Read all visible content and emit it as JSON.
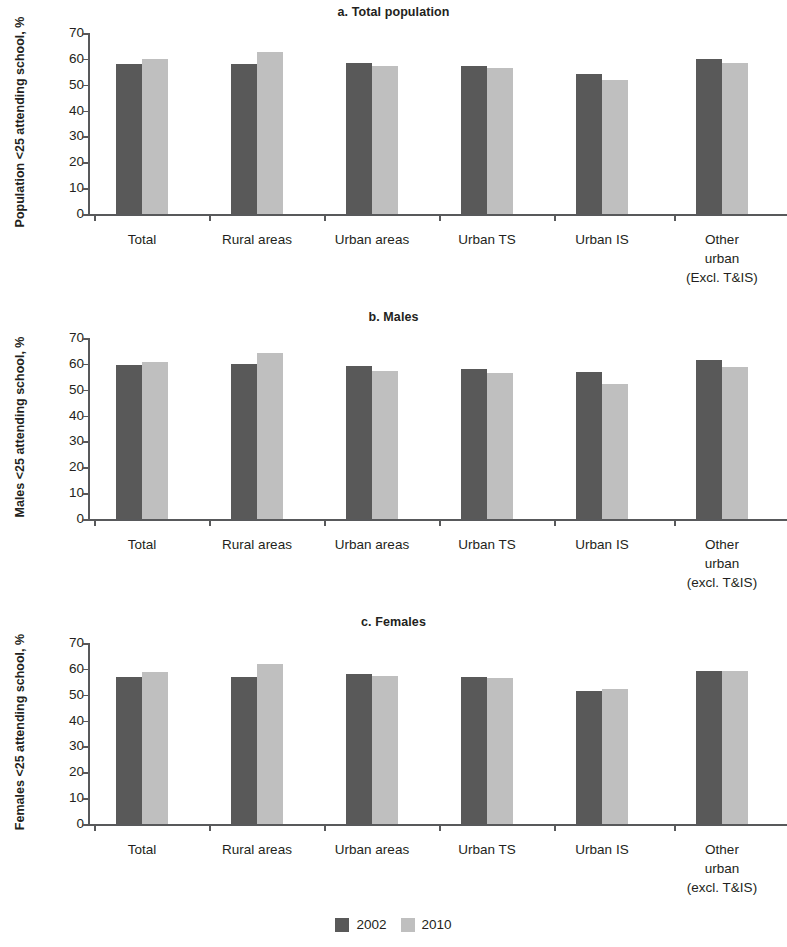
{
  "figure": {
    "legend": {
      "position": "bottom-center",
      "entries": [
        {
          "label": "2002",
          "color": "#595959"
        },
        {
          "label": "2010",
          "color": "#bfbfbf"
        }
      ]
    }
  },
  "chart_data": [
    {
      "type": "bar",
      "id": "a",
      "title": "a. Total population",
      "xlabel": "",
      "ylabel": "Population <25 attending school, %",
      "ylim": [
        0,
        70
      ],
      "yticks": [
        0,
        10,
        20,
        30,
        40,
        50,
        60,
        70
      ],
      "grid": false,
      "categories": [
        "Total",
        "Rural areas",
        "Urban areas",
        "Urban TS",
        "Urban IS",
        "Other urban (Excl. T&IS)"
      ],
      "category_lines": [
        [
          "Total"
        ],
        [
          "Rural areas"
        ],
        [
          "Urban areas"
        ],
        [
          "Urban TS"
        ],
        [
          "Urban IS"
        ],
        [
          "Other",
          "urban",
          "(Excl. T&IS)"
        ]
      ],
      "series": [
        {
          "name": "2002",
          "color": "#595959",
          "values": [
            58.0,
            58.0,
            58.3,
            57.4,
            54.0,
            59.8
          ]
        },
        {
          "name": "2010",
          "color": "#bfbfbf",
          "values": [
            60.1,
            62.5,
            57.3,
            56.4,
            52.0,
            58.5
          ]
        }
      ]
    },
    {
      "type": "bar",
      "id": "b",
      "title": "b. Males",
      "xlabel": "",
      "ylabel": "Males <25 attending school, %",
      "ylim": [
        0,
        70
      ],
      "yticks": [
        0,
        10,
        20,
        30,
        40,
        50,
        60,
        70
      ],
      "grid": false,
      "categories": [
        "Total",
        "Rural areas",
        "Urban areas",
        "Urban TS",
        "Urban IS",
        "Other urban (excl. T&IS)"
      ],
      "category_lines": [
        [
          "Total"
        ],
        [
          "Rural areas"
        ],
        [
          "Urban areas"
        ],
        [
          "Urban TS"
        ],
        [
          "Urban IS"
        ],
        [
          "Other",
          "urban",
          "(excl. T&IS)"
        ]
      ],
      "series": [
        {
          "name": "2002",
          "color": "#595959",
          "values": [
            59.6,
            60.0,
            59.3,
            58.0,
            56.7,
            61.4
          ]
        },
        {
          "name": "2010",
          "color": "#bfbfbf",
          "values": [
            60.6,
            64.1,
            57.4,
            56.6,
            52.3,
            58.7
          ]
        }
      ]
    },
    {
      "type": "bar",
      "id": "c",
      "title": "c. Females",
      "xlabel": "",
      "ylabel": "Females <25 attending school, %",
      "ylim": [
        0,
        70
      ],
      "yticks": [
        0,
        10,
        20,
        30,
        40,
        50,
        60,
        70
      ],
      "grid": false,
      "categories": [
        "Total",
        "Rural areas",
        "Urban areas",
        "Urban TS",
        "Urban IS",
        "Other urban (excl. T&IS)"
      ],
      "category_lines": [
        [
          "Total"
        ],
        [
          "Rural areas"
        ],
        [
          "Urban areas"
        ],
        [
          "Urban TS"
        ],
        [
          "Urban IS"
        ],
        [
          "Other",
          "urban",
          "(excl. T&IS)"
        ]
      ],
      "series": [
        {
          "name": "2002",
          "color": "#595959",
          "values": [
            56.8,
            56.7,
            57.9,
            56.9,
            51.3,
            59.2
          ]
        },
        {
          "name": "2010",
          "color": "#bfbfbf",
          "values": [
            58.9,
            61.7,
            57.3,
            56.5,
            52.1,
            59.2
          ]
        }
      ]
    }
  ]
}
